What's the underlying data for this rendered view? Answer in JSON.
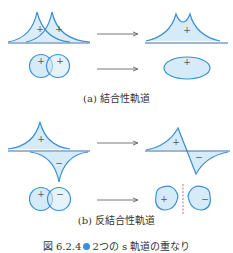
{
  "panels": [
    {
      "id": "a",
      "caption": "(a) 結合性軌道",
      "wave_before_signs": [
        "+",
        "+"
      ],
      "wave_after_signs": [
        "+"
      ],
      "orbital_before_signs": [
        "+",
        "+"
      ],
      "orbital_after_signs": [
        "+"
      ]
    },
    {
      "id": "b",
      "caption": "(b) 反結合性軌道",
      "wave_before_signs": [
        "+",
        "−"
      ],
      "wave_after_signs": [
        "+",
        "−"
      ],
      "orbital_before_signs": [
        "+",
        "−"
      ],
      "orbital_after_signs": [
        "+",
        "−"
      ]
    }
  ],
  "figure_caption": {
    "number": "図 6.2.4",
    "text": "2つの s 軌道の重なり"
  },
  "colors": {
    "stroke": "#3a8fd6",
    "fill": "#d6ebf8",
    "axis": "#3a6fa8",
    "arrow": "#555555",
    "node_line": "#c0504d"
  }
}
